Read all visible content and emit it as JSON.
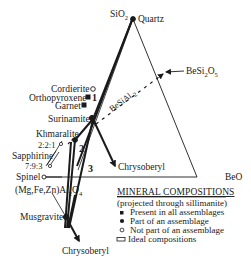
{
  "diagram": {
    "type": "ternary-compositional-diagram",
    "apices": {
      "top": {
        "label": "SiO",
        "subscript": "2"
      },
      "right": {
        "label": "BeO"
      },
      "left": {
        "label": "(Mg,Fe,Zn)Al",
        "subscript": "2",
        "label_suffix": "O",
        "subscript2": "4"
      }
    },
    "minerals": {
      "quartz": "Quartz",
      "cordierite": "Cordierite",
      "orthopyroxene": "Orthopyroxene",
      "garnet": "Garnet",
      "surinamite": "Surinamite",
      "khmaralite": "Khmaralite",
      "ratio_221": "2:2:1",
      "sapphirine": "Sapphirine",
      "ratio_793": "7:9:3",
      "spinel": "Spinel",
      "musgravite": "Musgravite",
      "chrysoberyl_right": "Chrysoberyl",
      "chrysoberyl_bottom": "Chrysoberyl",
      "besi2o5": {
        "label": "BeSi",
        "sub1": "2",
        "mid": "O",
        "sub2": "5"
      },
      "besial_line": {
        "label": "BeSiAl",
        "sub": "-2"
      }
    },
    "field_numbers": {
      "one": "1",
      "two": "2",
      "three": "3"
    },
    "legend": {
      "title": "MINERAL COMPOSITIONS",
      "subtitle": "(projected through sillimanite)",
      "items": [
        {
          "symbol": "filled-square",
          "label": "Present in all assemblages"
        },
        {
          "symbol": "filled-circle",
          "label": "Part of an assemblage"
        },
        {
          "symbol": "open-circle",
          "label": "Not part of an assemblage"
        },
        {
          "symbol": "open-rectangle",
          "label": "Ideal compositions"
        }
      ]
    },
    "colors": {
      "ink": "#1a1a1a",
      "background": "#ffffff"
    }
  }
}
